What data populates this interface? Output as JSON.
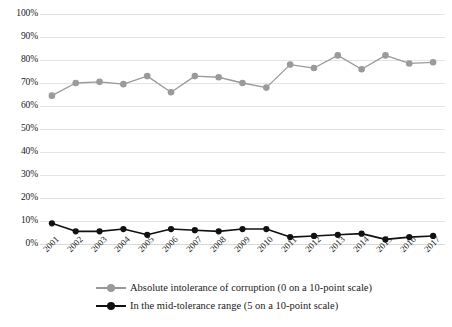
{
  "chart_data": {
    "type": "line",
    "title": "",
    "subtitle": "",
    "xlabel": "",
    "ylabel": "",
    "grid": true,
    "legend_position": "bottom",
    "ylim": [
      0,
      100
    ],
    "ytick_labels": [
      "100%",
      "90%",
      "80%",
      "70%",
      "60%",
      "50%",
      "40%",
      "30%",
      "20%",
      "10%",
      "0%"
    ],
    "ytick_values": [
      100,
      90,
      80,
      70,
      60,
      50,
      40,
      30,
      20,
      10,
      0
    ],
    "categories": [
      "2001",
      "2002",
      "2003",
      "2004",
      "2005",
      "2006",
      "2007",
      "2008",
      "2009",
      "2010",
      "2011",
      "2012",
      "2013",
      "2014",
      "2015",
      "2016",
      "2017"
    ],
    "series": [
      {
        "name": "Absolute intolerance of corruption (0 on a 10-point scale)",
        "color": "#9a9a9a",
        "marker": "circle",
        "values": [
          64.5,
          70.0,
          70.5,
          69.5,
          73.0,
          66.0,
          73.0,
          72.5,
          70.0,
          68.0,
          78.0,
          76.5,
          82.0,
          76.0,
          82.0,
          78.5,
          79.0
        ]
      },
      {
        "name": "In the mid-tolerance range (5 on a 10-point scale)",
        "color": "#111111",
        "marker": "circle",
        "values": [
          9.0,
          5.5,
          5.5,
          6.5,
          4.0,
          6.5,
          6.0,
          5.5,
          6.5,
          6.5,
          3.0,
          3.5,
          4.0,
          4.5,
          2.0,
          3.0,
          3.5
        ]
      }
    ]
  },
  "legend": {
    "items": [
      {
        "label": "Absolute intolerance of corruption (0 on a 10-point scale)",
        "color": "#9a9a9a"
      },
      {
        "label": "In the mid-tolerance range (5 on a 10-point scale)",
        "color": "#111111"
      }
    ]
  },
  "colors": {
    "gridline": "#e3e3e3",
    "background": "#ffffff",
    "text": "#1a1a1a",
    "series_gray": "#9a9a9a",
    "series_black": "#111111"
  }
}
